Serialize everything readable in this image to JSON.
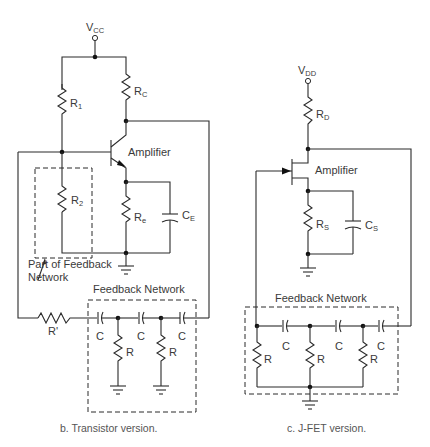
{
  "figure": {
    "panels": [
      {
        "id": "b",
        "caption": "b.  Transistor version.",
        "supply": {
          "main": "V",
          "sub": "CC"
        },
        "amplifier_label": "Amplifier",
        "components": {
          "r1": {
            "main": "R",
            "sub": "1"
          },
          "rc": {
            "main": "R",
            "sub": "C"
          },
          "r2": {
            "main": "R",
            "sub": "2"
          },
          "re": {
            "main": "R",
            "sub": "e"
          },
          "ce": {
            "main": "C",
            "sub": "E"
          },
          "r_prime": "R'"
        },
        "part_of_feedback_line1": "Part of Feedback",
        "part_of_feedback_line2": "Network",
        "feedback_title": "Feedback Network",
        "feedback_caps": [
          "C",
          "C",
          "C"
        ],
        "feedback_resistors": [
          "R",
          "R"
        ]
      },
      {
        "id": "c",
        "caption": "c.  J-FET version.",
        "supply": {
          "main": "V",
          "sub": "DD"
        },
        "amplifier_label": "Amplifier",
        "components": {
          "rd": {
            "main": "R",
            "sub": "D"
          },
          "rs": {
            "main": "R",
            "sub": "S"
          },
          "cs": {
            "main": "C",
            "sub": "S"
          }
        },
        "feedback_title": "Feedback Network",
        "feedback_caps": [
          "C",
          "C",
          "C"
        ],
        "feedback_resistors": [
          "R",
          "R",
          "R"
        ]
      }
    ]
  }
}
